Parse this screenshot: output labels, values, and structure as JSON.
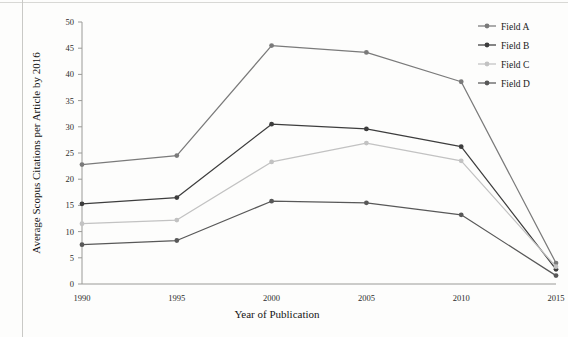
{
  "chart_data": {
    "type": "line",
    "title": "",
    "xlabel": "Year of Publication",
    "ylabel": "Average Scopus Citations per Article by 2016",
    "x": [
      1990,
      1995,
      2000,
      2005,
      2010,
      2015
    ],
    "categories": [
      "1990",
      "1995",
      "2000",
      "2005",
      "2010",
      "2015"
    ],
    "xlim": [
      1990,
      2015
    ],
    "ylim": [
      0,
      50
    ],
    "yticks": [
      0,
      5,
      10,
      15,
      20,
      25,
      30,
      35,
      40,
      45,
      50
    ],
    "ytick_labels": [
      "0",
      "5",
      "10",
      "15",
      "20",
      "25",
      "30",
      "35",
      "40",
      "45",
      "50"
    ],
    "xtick_labels": [
      "1990",
      "1995",
      "2000",
      "2005",
      "2010",
      "2015"
    ],
    "grid": false,
    "legend_position": "top-right",
    "markers": "circle",
    "series": [
      {
        "name": "Field A",
        "color": "#7a7a7a",
        "values": [
          22.8,
          24.5,
          45.5,
          44.2,
          38.6,
          4.0
        ]
      },
      {
        "name": "Field B",
        "color": "#3d3d3d",
        "values": [
          15.3,
          16.5,
          30.5,
          29.6,
          26.2,
          2.8
        ]
      },
      {
        "name": "Field C",
        "color": "#c2c2c2",
        "values": [
          11.5,
          12.2,
          23.3,
          26.9,
          23.5,
          3.3
        ]
      },
      {
        "name": "Field D",
        "color": "#585858",
        "values": [
          7.5,
          8.3,
          15.8,
          15.5,
          13.2,
          1.6
        ]
      }
    ]
  },
  "legend": {
    "items": [
      "Field A",
      "Field B",
      "Field C",
      "Field D"
    ]
  }
}
